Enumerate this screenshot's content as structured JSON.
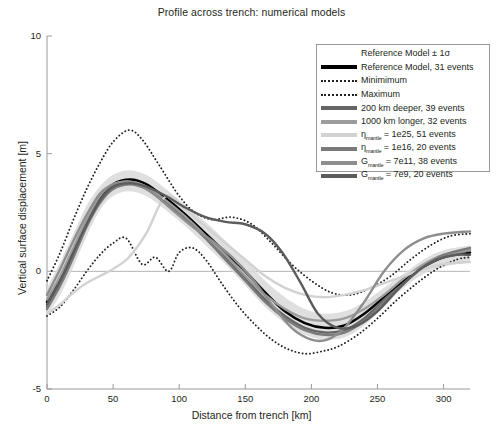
{
  "chart_data": {
    "type": "line",
    "title": "Profile across trench: numerical models",
    "xlabel": "Distance from trench [km]",
    "ylabel": "Vertical surface displacement [m]",
    "xlim": [
      0,
      320
    ],
    "ylim": [
      -5,
      10
    ],
    "xticks": [
      0,
      50,
      100,
      150,
      200,
      250,
      300
    ],
    "yticks": [
      -5,
      0,
      5,
      10
    ],
    "grid": false,
    "legend_position": "top-right",
    "zero_line": true,
    "series": [
      {
        "name": "Reference Model ± 1σ",
        "style": "band",
        "color": "#d9d9d9",
        "x": [
          0,
          10,
          20,
          30,
          40,
          50,
          62,
          75,
          90,
          105,
          120,
          135,
          150,
          165,
          180,
          195,
          210,
          225,
          240,
          255,
          270,
          285,
          300,
          320
        ],
        "upper": [
          -0.7,
          0.4,
          1.6,
          2.8,
          3.6,
          4.1,
          4.3,
          4.1,
          3.5,
          2.8,
          2.1,
          1.3,
          0.5,
          -0.4,
          -1.1,
          -1.6,
          -1.8,
          -1.7,
          -1.3,
          -0.7,
          -0.1,
          0.5,
          0.9,
          1.1
        ],
        "lower": [
          -1.9,
          -1.0,
          0.2,
          1.5,
          2.6,
          3.2,
          3.4,
          3.2,
          2.6,
          1.9,
          1.1,
          0.3,
          -0.6,
          -1.5,
          -2.2,
          -2.7,
          -2.9,
          -2.8,
          -2.3,
          -1.5,
          -0.7,
          -0.1,
          0.2,
          0.4
        ]
      },
      {
        "name": "Reference Model, 31 events",
        "style": "solid",
        "width": 2.6,
        "color": "#000000",
        "x": [
          0,
          10,
          20,
          30,
          40,
          50,
          63,
          75,
          90,
          105,
          120,
          135,
          150,
          165,
          180,
          195,
          210,
          225,
          240,
          255,
          270,
          285,
          300,
          320
        ],
        "y": [
          -1.3,
          -0.3,
          0.9,
          2.1,
          3.1,
          3.7,
          3.9,
          3.7,
          3.1,
          2.4,
          1.6,
          0.8,
          0.0,
          -0.9,
          -1.7,
          -2.2,
          -2.4,
          -2.3,
          -1.8,
          -1.1,
          -0.4,
          0.2,
          0.6,
          0.8
        ]
      },
      {
        "name": "Minimimum",
        "style": "dotted",
        "width": 1.9,
        "color": "#231f20",
        "x": [
          0,
          10,
          20,
          30,
          40,
          50,
          60,
          72,
          82,
          92,
          100,
          110,
          120,
          132,
          145,
          158,
          170,
          182,
          195,
          208,
          220,
          235,
          250,
          265,
          280,
          295,
          310,
          320
        ],
        "y": [
          -1.9,
          -1.5,
          -0.8,
          0.0,
          0.7,
          1.2,
          1.4,
          0.3,
          0.6,
          0.0,
          0.8,
          1.0,
          0.5,
          -0.5,
          -1.5,
          -2.3,
          -2.9,
          -3.3,
          -3.5,
          -3.4,
          -3.2,
          -2.7,
          -2.0,
          -1.2,
          -0.5,
          0.1,
          0.5,
          0.6
        ]
      },
      {
        "name": "Maximum",
        "style": "dotted",
        "width": 1.9,
        "color": "#231f20",
        "x": [
          0,
          10,
          20,
          30,
          40,
          50,
          62,
          72,
          85,
          100,
          112,
          125,
          140,
          155,
          170,
          185,
          200,
          215,
          230,
          245,
          260,
          275,
          290,
          305,
          320
        ],
        "y": [
          -0.4,
          0.8,
          2.2,
          3.5,
          4.6,
          5.5,
          6.0,
          5.6,
          4.5,
          3.2,
          2.5,
          2.2,
          2.3,
          2.0,
          1.2,
          0.3,
          -0.4,
          -0.9,
          -1.0,
          -0.7,
          -0.2,
          0.5,
          1.1,
          1.5,
          1.6
        ]
      },
      {
        "name": "200 km deeper, 39 events",
        "style": "solid",
        "width": 2.4,
        "color": "#666666",
        "x": [
          0,
          10,
          20,
          30,
          40,
          50,
          63,
          75,
          90,
          105,
          120,
          135,
          150,
          165,
          180,
          195,
          210,
          225,
          240,
          255,
          270,
          285,
          300,
          320
        ],
        "y": [
          -1.5,
          -0.5,
          0.7,
          2.0,
          3.0,
          3.6,
          3.8,
          3.6,
          3.0,
          2.3,
          1.5,
          0.6,
          -0.3,
          -1.2,
          -1.9,
          -2.4,
          -2.6,
          -2.5,
          -2.0,
          -1.2,
          -0.5,
          0.2,
          0.6,
          0.9
        ]
      },
      {
        "name": "1000 km longer, 32 events",
        "style": "solid",
        "width": 2.4,
        "color": "#9c9c9c",
        "x": [
          0,
          10,
          20,
          30,
          40,
          50,
          63,
          75,
          90,
          105,
          120,
          135,
          150,
          165,
          180,
          195,
          210,
          225,
          240,
          255,
          270,
          285,
          300,
          320
        ],
        "y": [
          -1.2,
          -0.2,
          1.0,
          2.2,
          3.2,
          3.7,
          3.8,
          3.6,
          3.0,
          2.3,
          1.5,
          0.7,
          -0.2,
          -1.0,
          -1.6,
          -2.0,
          -2.1,
          -2.0,
          -1.6,
          -1.0,
          -0.3,
          0.3,
          0.7,
          0.9
        ]
      },
      {
        "name": "ηmantle = 1e25, 51 events",
        "eta_label": "η",
        "eta_sub": "mantle",
        "value_text": " = 1e25, 51 events",
        "style": "solid",
        "width": 2.4,
        "color": "#d2d2d2",
        "x": [
          0,
          10,
          20,
          30,
          40,
          50,
          62,
          75,
          90,
          105,
          120,
          135,
          150,
          165,
          180,
          195,
          210,
          225,
          240,
          255,
          270,
          285,
          300,
          320
        ],
        "y": [
          -1.8,
          -1.4,
          -0.9,
          -0.5,
          -0.2,
          0.1,
          0.6,
          1.6,
          3.2,
          2.6,
          1.9,
          1.2,
          0.5,
          -0.2,
          -0.7,
          -1.0,
          -1.1,
          -1.0,
          -0.8,
          -0.5,
          -0.2,
          0.1,
          0.3,
          0.4
        ]
      },
      {
        "name": "ηmantle = 1e16, 20 events",
        "eta_label": "η",
        "eta_sub": "mantle",
        "value_text": " = 1e16, 20 events",
        "style": "solid",
        "width": 2.4,
        "color": "#7a7a7a",
        "x": [
          0,
          10,
          20,
          30,
          40,
          50,
          63,
          75,
          90,
          105,
          120,
          135,
          150,
          165,
          180,
          195,
          210,
          225,
          240,
          255,
          270,
          285,
          300,
          320
        ],
        "y": [
          -1.6,
          -0.6,
          0.6,
          1.9,
          2.9,
          3.5,
          3.7,
          3.5,
          2.9,
          2.2,
          1.4,
          0.5,
          -0.4,
          -1.3,
          -2.0,
          -2.5,
          -2.7,
          -2.6,
          -2.1,
          -1.3,
          -0.5,
          0.2,
          0.7,
          1.0
        ]
      },
      {
        "name": "Gmantle = 7e11, 38 events",
        "eta_label": "G",
        "eta_sub": "mantle",
        "value_text": " = 7e11, 38 events",
        "style": "solid",
        "width": 2.4,
        "color": "#8e8e8e",
        "x": [
          0,
          10,
          20,
          30,
          40,
          50,
          63,
          78,
          95,
          110,
          125,
          140,
          155,
          170,
          185,
          200,
          212,
          225,
          240,
          255,
          270,
          285,
          300,
          320
        ],
        "y": [
          -1.0,
          0.1,
          1.3,
          2.4,
          3.3,
          3.7,
          3.8,
          3.4,
          2.6,
          1.9,
          1.3,
          0.6,
          -0.3,
          -1.4,
          -2.4,
          -2.9,
          -2.9,
          -2.4,
          -1.3,
          0.0,
          0.9,
          1.4,
          1.6,
          1.7
        ]
      },
      {
        "name": "Gmantle = 7e9, 20 events",
        "eta_label": "G",
        "eta_sub": "mantle",
        "value_text": " = 7e9, 20 events",
        "style": "solid",
        "width": 2.4,
        "color": "#5c5c5c",
        "x": [
          0,
          10,
          20,
          30,
          40,
          50,
          63,
          75,
          90,
          105,
          120,
          135,
          150,
          165,
          178,
          192,
          205,
          220,
          235,
          250,
          265,
          280,
          295,
          310,
          320
        ],
        "y": [
          -1.4,
          -0.4,
          0.8,
          2.0,
          3.0,
          3.6,
          3.75,
          3.6,
          3.2,
          2.7,
          2.3,
          2.1,
          2.0,
          1.6,
          0.8,
          -0.5,
          -1.8,
          -2.4,
          -2.3,
          -1.7,
          -0.8,
          0.0,
          0.5,
          0.7,
          0.7
        ]
      }
    ]
  },
  "header": {
    "title": "Profile across trench: numerical models"
  },
  "axes": {
    "x_label": "Distance from trench [km]",
    "y_label": "Vertical surface displacement [m]",
    "x_ticks": [
      "0",
      "50",
      "100",
      "150",
      "200",
      "250",
      "300"
    ],
    "y_ticks": [
      "10",
      "5",
      "0",
      "-5"
    ]
  },
  "legend": {
    "entries": [
      {
        "label": "Reference Model ± 1σ",
        "swatch": "none",
        "color": "#d9d9d9"
      },
      {
        "label": "Reference Model, 31 events",
        "swatch": "solid",
        "color": "#000000",
        "thickness": 4
      },
      {
        "label": "Minimimum",
        "swatch": "dotted",
        "color": "#231f20",
        "thickness": 2
      },
      {
        "label": "Maximum",
        "swatch": "dotted",
        "color": "#231f20",
        "thickness": 2
      },
      {
        "label": "200 km deeper, 39 events",
        "swatch": "solid",
        "color": "#666666",
        "thickness": 4
      },
      {
        "label": "1000 km longer, 32 events",
        "swatch": "solid",
        "color": "#9c9c9c",
        "thickness": 4
      },
      {
        "label": "= 1e25, 51 events",
        "prefix": "η",
        "sub": "mantle",
        "swatch": "solid",
        "color": "#d2d2d2",
        "thickness": 4
      },
      {
        "label": "= 1e16, 20 events",
        "prefix": "η",
        "sub": "mantle",
        "swatch": "solid",
        "color": "#7a7a7a",
        "thickness": 4
      },
      {
        "label": "= 7e11, 38 events",
        "prefix": "G",
        "sub": "mantle",
        "swatch": "solid",
        "color": "#8e8e8e",
        "thickness": 4
      },
      {
        "label": "= 7e9, 20 events",
        "prefix": "G",
        "sub": "mantle",
        "swatch": "solid",
        "color": "#5c5c5c",
        "thickness": 4
      }
    ]
  },
  "colors": {
    "axis": "#9a9a9a",
    "text": "#231f20",
    "zero_line": "#b5b5b5",
    "background": "#ffffff"
  }
}
